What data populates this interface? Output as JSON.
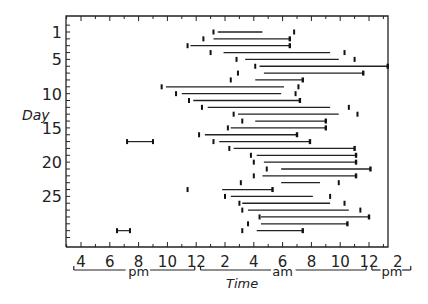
{
  "chart_data": {
    "type": "bar",
    "subtype": "actogram (horizontal interval bars per day)",
    "title": "",
    "xlabel": "Time",
    "ylabel": "Day",
    "x_unit": "hours (clock time; 16 = 4 pm, 24 = midnight, 36 = noon, 38 = 2 pm next day)",
    "xlim": [
      15,
      39
    ],
    "ylim": [
      30,
      0
    ],
    "x_ticks": [
      {
        "h": 16,
        "label": "4"
      },
      {
        "h": 18,
        "label": "6"
      },
      {
        "h": 20,
        "label": "8"
      },
      {
        "h": 22,
        "label": "10"
      },
      {
        "h": 24,
        "label": "12"
      },
      {
        "h": 26,
        "label": "2"
      },
      {
        "h": 28,
        "label": "4"
      },
      {
        "h": 30,
        "label": "6"
      },
      {
        "h": 32,
        "label": "8"
      },
      {
        "h": 34,
        "label": "10"
      },
      {
        "h": 36,
        "label": "12"
      },
      {
        "h": 38,
        "label": "2"
      }
    ],
    "x_period_labels": [
      {
        "label": "pm",
        "from": 15.5,
        "to": 24
      },
      {
        "label": "am",
        "from": 24,
        "to": 36
      },
      {
        "label": "pm",
        "from": 36,
        "to": 39
      }
    ],
    "y_ticks": [
      1,
      5,
      10,
      15,
      20,
      25
    ],
    "grid": false,
    "legend": null,
    "rows": [
      {
        "day": 1,
        "marker": 25.2,
        "start": 25.5,
        "end": 28.6,
        "end_marker": 30.8
      },
      {
        "day": 2,
        "marker": 24.5,
        "start": 25.2,
        "end": 30.5
      },
      {
        "day": 3,
        "marker": 23.4,
        "start": 23.6,
        "end": 30.5
      },
      {
        "day": 4,
        "marker": 25.0,
        "start": 25.9,
        "end": 33.3,
        "end_marker": 34.3
      },
      {
        "day": 5,
        "marker": 26.8,
        "start": 27.4,
        "end": 33.9,
        "end_marker": 35.0
      },
      {
        "day": 6,
        "marker": 28.1,
        "start": 28.4,
        "end": 37.3
      },
      {
        "day": 7,
        "marker": 26.9,
        "start": 28.7,
        "end": 35.6
      },
      {
        "day": 8,
        "marker": 26.4,
        "start": 28.1,
        "end": 31.4
      },
      {
        "day": 9,
        "marker": 21.6,
        "start": 21.9,
        "end": 30.1,
        "end_marker": 31.1
      },
      {
        "day": 10,
        "marker": 22.6,
        "start": 23.0,
        "end": 29.9,
        "end_marker": 30.9
      },
      {
        "day": 11,
        "marker": 23.5,
        "start": 23.8,
        "end": 31.2
      },
      {
        "day": 12,
        "marker": 24.4,
        "start": 24.8,
        "end": 33.3,
        "end_marker": 34.6
      },
      {
        "day": 13,
        "marker": 26.6,
        "start": 26.9,
        "end": 33.9,
        "end_marker": 35.2
      },
      {
        "day": 14,
        "marker": 27.2,
        "start": 28.1,
        "end": 33.0
      },
      {
        "day": 15,
        "marker": 26.2,
        "start": 26.4,
        "end": 33.0
      },
      {
        "day": 16,
        "marker": 24.2,
        "start": 24.6,
        "end": 31.0
      },
      {
        "day": 17,
        "marker": 19.2,
        "start": 19.2,
        "end": 21.0
      },
      {
        "day": 17,
        "marker": 25.2,
        "start": 25.6,
        "end": 31.9
      },
      {
        "day": 18,
        "marker": 26.3,
        "start": 26.6,
        "end": 35.0
      },
      {
        "day": 19,
        "marker": 27.8,
        "start": 28.2,
        "end": 35.1
      },
      {
        "day": 20,
        "marker": 28.0,
        "start": 28.7,
        "end": 35.1
      },
      {
        "day": 21,
        "marker": 28.9,
        "start": 29.9,
        "end": 36.1
      },
      {
        "day": 22,
        "marker": 28.0,
        "start": 28.6,
        "end": 35.1
      },
      {
        "day": 23,
        "marker": 27.1,
        "start": 29.9,
        "end": 32.6,
        "end_marker": 33.9
      },
      {
        "day": 24,
        "marker": 23.4,
        "start": 25.8,
        "end": 29.3
      },
      {
        "day": 25,
        "marker": 26.0,
        "start": 26.4,
        "end": 32.1,
        "end_marker": 33.3
      },
      {
        "day": 26,
        "marker": 27.0,
        "start": 27.2,
        "end": 33.3,
        "end_marker": 34.3
      },
      {
        "day": 27,
        "marker": 27.2,
        "start": 27.6,
        "end": 34.6,
        "end_marker": 35.4
      },
      {
        "day": 28,
        "marker": 28.4,
        "start": 28.5,
        "end": 36.0
      },
      {
        "day": 29,
        "marker": 27.6,
        "start": 28.5,
        "end": 34.5
      },
      {
        "day": 30,
        "marker": 18.5,
        "start": 18.5,
        "end": 19.4
      },
      {
        "day": 30,
        "marker": 27.2,
        "start": 28.2,
        "end": 31.4
      }
    ]
  },
  "axis": {
    "x_title": "Time",
    "y_title": "Day",
    "period_pm1": "pm",
    "period_am": "am",
    "period_pm2": "pm"
  }
}
